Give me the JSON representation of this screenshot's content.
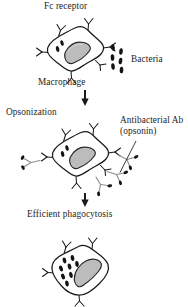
{
  "figure": {
    "background_color": "#ffffff",
    "ink_color": "#1a1a1a",
    "nucleus_fill": "#b8b8b8",
    "antibody_color": "#9a9a9a",
    "bacteria_color": "#1a1a1a"
  },
  "labels": {
    "fc_receptor": "Fc receptor",
    "bacteria": "Bacteria",
    "macrophage": "Macrophage",
    "opsonization": "Opsonization",
    "antibacterial_ab": "Antibacterial Ab (opsonin)",
    "efficient_phagocytosis": "Efficient phagocytosis"
  },
  "stages": [
    {
      "name": "free-bacteria-stage",
      "description": "Macrophage with Fc receptors and free unopsonized bacteria nearby",
      "fc_receptor_count": 6,
      "internal_granule_count": 2,
      "free_bacteria_count": 6
    },
    {
      "name": "opsonization-stage",
      "description": "Bacteria coated with antibacterial antibody bind Fc receptors",
      "fc_receptor_count": 6,
      "internal_granule_count": 2,
      "antibody_complex_count": 4
    },
    {
      "name": "phagocytosis-stage",
      "description": "Macrophage after efficient phagocytosis with many ingested bacteria",
      "fc_receptor_count": 4,
      "internal_granule_count": 8
    }
  ],
  "arrows": [
    {
      "name": "arrow-stage1-to-stage2",
      "direction": "down"
    },
    {
      "name": "arrow-stage2-to-stage3",
      "direction": "down"
    }
  ],
  "leader_lines": [
    {
      "name": "leader-antibacterial-ab",
      "from": "antibacterial-ab-label",
      "to": "antibody-complex"
    }
  ]
}
